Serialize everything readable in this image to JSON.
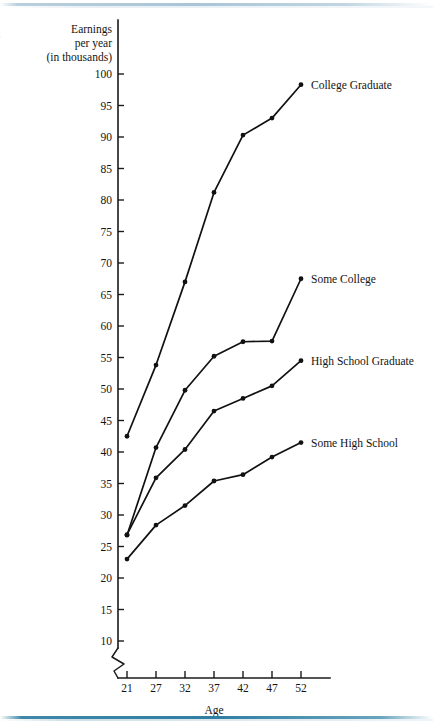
{
  "figure": {
    "margin_glyph": "e",
    "y_axis_title_lines": [
      "Earnings",
      "per year",
      "(in thousands)"
    ],
    "x_axis_title": "Age",
    "has_y_axis_break": true
  },
  "chart_data": {
    "type": "line",
    "title": "",
    "subtitle": "",
    "xlabel": "Age",
    "ylabel": "Earnings per year (in thousands)",
    "x": [
      21,
      27,
      32,
      37,
      42,
      47,
      52
    ],
    "xticklabels": [
      "21",
      "27",
      "32",
      "37",
      "42",
      "47",
      "52"
    ],
    "yticks": [
      10,
      15,
      20,
      25,
      30,
      35,
      40,
      45,
      50,
      55,
      60,
      65,
      70,
      75,
      80,
      85,
      90,
      95,
      100
    ],
    "yticklabels": [
      "10",
      "15",
      "20",
      "25",
      "30",
      "35",
      "40",
      "45",
      "50",
      "55",
      "60",
      "65",
      "70",
      "75",
      "80",
      "85",
      "90",
      "95",
      "100"
    ],
    "ylim": [
      8,
      102
    ],
    "xlim": [
      18.5,
      54.5
    ],
    "grid": false,
    "legend_position": "right-of-line-ends",
    "axis_break_below": 10,
    "series": [
      {
        "name": "College Graduate",
        "label": "College Graduate",
        "color": "#111111",
        "values": [
          42.5,
          53.8,
          67.0,
          81.2,
          90.3,
          93.0,
          98.3
        ]
      },
      {
        "name": "Some College",
        "label": "Some College",
        "color": "#111111",
        "values": [
          26.8,
          40.7,
          49.8,
          55.2,
          57.5,
          57.6,
          67.5
        ]
      },
      {
        "name": "High School Graduate",
        "label": "High School Graduate",
        "color": "#111111",
        "values": [
          26.9,
          35.9,
          40.4,
          46.5,
          48.5,
          50.5,
          54.5
        ]
      },
      {
        "name": "Some High School",
        "label": "Some High School",
        "color": "#111111",
        "values": [
          23.0,
          28.4,
          31.5,
          35.4,
          36.4,
          39.2,
          41.5
        ]
      }
    ]
  }
}
